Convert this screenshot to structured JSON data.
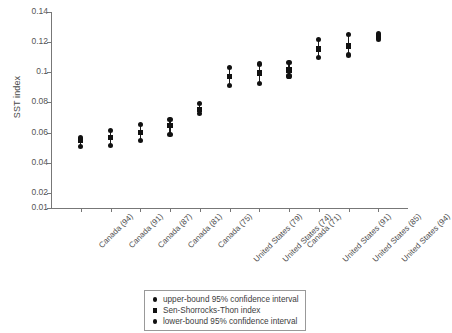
{
  "chart_data": {
    "type": "scatter",
    "title": "",
    "xlabel": "",
    "ylabel": "SST index",
    "ylim": [
      0.01,
      0.14
    ],
    "yticks": [
      0.01,
      0.02,
      0.04,
      0.06,
      0.08,
      0.1,
      0.12,
      0.14
    ],
    "ytick_labels": [
      "0.01",
      "0.02",
      "0.04",
      "0.06",
      "0.08",
      "0.1",
      "0.12",
      "0.14"
    ],
    "grid": false,
    "legend_position": "below-axes-center",
    "categories": [
      "Canada (94)",
      "Canada (91)",
      "Canada (87)",
      "Canada (81)",
      "Canada (75)",
      "United States (79)",
      "United States (74)",
      "Canada (71)",
      "United States (91)",
      "United States (85)",
      "United States (94)"
    ],
    "series": [
      {
        "name": "upper-bound 95% confidence interval",
        "marker": "circle",
        "values": [
          0.057,
          0.0615,
          0.0655,
          0.0685,
          0.0795,
          0.103,
          0.1055,
          0.1065,
          0.1215,
          0.125,
          0.126
        ]
      },
      {
        "name": "Sen-Shorrocks-Thon index",
        "marker": "square",
        "values": [
          0.0545,
          0.0565,
          0.06,
          0.0645,
          0.0755,
          0.097,
          0.0995,
          0.1015,
          0.1155,
          0.1175,
          0.1235
        ]
      },
      {
        "name": "lower-bound 95% confidence interval",
        "marker": "circle",
        "values": [
          0.051,
          0.0515,
          0.0545,
          0.059,
          0.0725,
          0.0915,
          0.0925,
          0.0975,
          0.11,
          0.1115,
          0.1215
        ]
      }
    ]
  },
  "legend": {
    "items": [
      {
        "label": "upper-bound 95% confidence interval",
        "marker": "circle"
      },
      {
        "label": "Sen-Shorrocks-Thon index",
        "marker": "square"
      },
      {
        "label": "lower-bound 95% confidence interval",
        "marker": "circle"
      }
    ]
  },
  "colors": {
    "marker": "#111111",
    "axis": "#777777",
    "text": "#3d3d3d"
  }
}
